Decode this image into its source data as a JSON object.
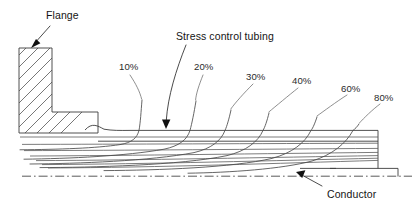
{
  "figure": {
    "type": "technical-diagram",
    "background_color": "#ffffff",
    "line_color": "#3c3c3c"
  },
  "annotations": {
    "flange": {
      "label": "Flange",
      "x": 46,
      "y": 10,
      "leader_from": [
        50,
        26
      ],
      "leader_to": [
        33,
        45
      ]
    },
    "tubing": {
      "label": "Stress control tubing",
      "x": 176,
      "y": 31,
      "leader_from": [
        186,
        45
      ],
      "leader_to": [
        166,
        122
      ]
    },
    "conductor": {
      "label": "Conductor",
      "x": 327,
      "y": 189,
      "leader_from": [
        322,
        187
      ],
      "leader_to": [
        297,
        172
      ]
    }
  },
  "equipotentials": {
    "unit": "%",
    "labels": [
      {
        "value": "10%",
        "x": 119,
        "y": 62,
        "leader_from": [
          130,
          75
        ],
        "leader_to": [
          141,
          100
        ]
      },
      {
        "value": "20%",
        "x": 194,
        "y": 62,
        "leader_from": [
          203,
          75
        ],
        "leader_to": [
          195,
          101
        ]
      },
      {
        "value": "30%",
        "x": 246,
        "y": 72,
        "leader_from": [
          253,
          84
        ],
        "leader_to": [
          230,
          110
        ]
      },
      {
        "value": "40%",
        "x": 292,
        "y": 76,
        "leader_from": [
          298,
          88
        ],
        "leader_to": [
          268,
          113
        ]
      },
      {
        "value": "60%",
        "x": 341,
        "y": 84,
        "leader_from": [
          347,
          95
        ],
        "leader_to": [
          316,
          117
        ]
      },
      {
        "value": "80%",
        "x": 374,
        "y": 93,
        "leader_from": [
          380,
          104
        ],
        "leader_to": [
          358,
          124
        ]
      }
    ],
    "count": 6
  },
  "geometry": {
    "flange_vertical": {
      "x": 19,
      "y": 48,
      "width": 33,
      "height": 85
    },
    "flange_foot": {
      "x": 52,
      "y": 112,
      "width": 46,
      "height": 21
    },
    "tubing_surface_y": 130,
    "tubing_inner_y": 141,
    "conductor_top_y": 168,
    "centerline_y": 176,
    "right_edge_x": 378,
    "right_step_x": 398,
    "field_line_count": 7
  },
  "icons": {
    "arrow": "arrow-head-icon",
    "hatch": "hatch-pattern-icon"
  }
}
